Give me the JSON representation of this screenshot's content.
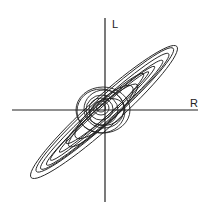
{
  "diagram": {
    "type": "stereo phase scope (Lissajous) pattern",
    "axes": {
      "vertical_label": "L",
      "horizontal_label": "R"
    },
    "colors": {
      "background": "#ffffff",
      "stroke": "#222222"
    }
  }
}
